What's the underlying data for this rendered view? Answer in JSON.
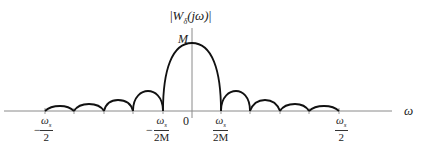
{
  "diagram": {
    "y_axis_label": {
      "prefix": "|",
      "W": "W",
      "sub": "δ",
      "arg": "(jω)",
      "suffix": "|"
    },
    "x_axis_label": "ω",
    "peak_label": "M",
    "origin_label": "0",
    "ticks": [
      {
        "sign": "−",
        "num": "ω",
        "num_sub": "s",
        "den": "2"
      },
      {
        "sign": "−",
        "num": "ω",
        "num_sub": "s",
        "den": "2M"
      },
      {
        "sign": "",
        "num": "ω",
        "num_sub": "s",
        "den": "2M"
      },
      {
        "sign": "",
        "num": "ω",
        "num_sub": "s",
        "den": "2"
      }
    ],
    "colors": {
      "curve": "#111111",
      "axis": "#888888",
      "text": "#222222"
    }
  }
}
